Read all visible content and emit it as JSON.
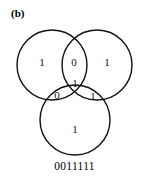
{
  "figure": {
    "panel_label": "(b)",
    "bitstring": "0011111",
    "stroke_color": "#111111",
    "background_color": "#ffffff",
    "text_color": "#111111"
  },
  "venn": {
    "circles": [
      {
        "name": "left-circle",
        "cx": 52,
        "cy": 65,
        "r": 35
      },
      {
        "name": "right-circle",
        "cx": 97,
        "cy": 65,
        "r": 35
      },
      {
        "name": "bottom-circle",
        "cx": 75,
        "cy": 120,
        "r": 35
      }
    ],
    "regions": [
      {
        "name": "left-only",
        "value": "1",
        "x": 42,
        "y": 63
      },
      {
        "name": "left-right-overlap",
        "value": "0",
        "x": 74,
        "y": 63
      },
      {
        "name": "right-only",
        "value": "1",
        "x": 107,
        "y": 63
      },
      {
        "name": "center-all-three",
        "value": "1",
        "x": 75,
        "y": 84
      },
      {
        "name": "left-bottom-overlap",
        "value": "0",
        "x": 57,
        "y": 96
      },
      {
        "name": "right-bottom-overlap",
        "value": "1",
        "x": 93,
        "y": 97
      },
      {
        "name": "bottom-only",
        "value": "1",
        "x": 75,
        "y": 130
      }
    ]
  }
}
